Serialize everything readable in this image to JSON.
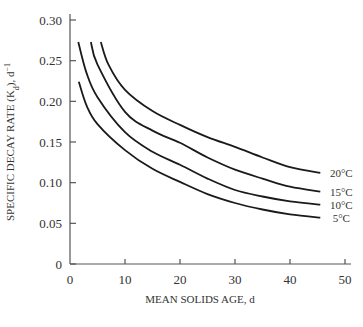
{
  "chart_data": {
    "type": "line",
    "title": "",
    "xlabel": "MEAN SOLIDS AGE, d",
    "ylabel": "SPECIFIC DECAY RATE (K",
    "ylabel_sub": "d",
    "ylabel_suffix": "), d",
    "ylabel_sup": "−1",
    "xlim": [
      0,
      50
    ],
    "ylim": [
      0,
      0.3
    ],
    "xticks": [
      0,
      10,
      20,
      30,
      40,
      50
    ],
    "xtick_labels": [
      "0",
      "10",
      "20",
      "30",
      "40",
      "50"
    ],
    "yticks": [
      0,
      0.05,
      0.1,
      0.15,
      0.2,
      0.25,
      0.3
    ],
    "ytick_labels": [
      "0",
      "0.05",
      "0.10",
      "0.15",
      "0.20",
      "0.25",
      "0.30"
    ],
    "grid": false,
    "legend_position": "inline labels at right end of curves",
    "series": [
      {
        "name": "20°C",
        "x": [
          5.6,
          7,
          10,
          15,
          20,
          25,
          30,
          35,
          40,
          45.5
        ],
        "values": [
          0.273,
          0.245,
          0.214,
          0.188,
          0.171,
          0.156,
          0.144,
          0.131,
          0.119,
          0.112
        ]
      },
      {
        "name": "15°C",
        "x": [
          3.8,
          5,
          10,
          15,
          20,
          25,
          30,
          35,
          40,
          45.5
        ],
        "values": [
          0.273,
          0.245,
          0.187,
          0.164,
          0.149,
          0.131,
          0.116,
          0.105,
          0.095,
          0.089
        ]
      },
      {
        "name": "10°C",
        "x": [
          1.5,
          3,
          5,
          10,
          15,
          20,
          25,
          30,
          35,
          40,
          45.5
        ],
        "values": [
          0.273,
          0.235,
          0.205,
          0.162,
          0.138,
          0.122,
          0.105,
          0.091,
          0.083,
          0.077,
          0.073
        ]
      },
      {
        "name": "5°C",
        "x": [
          1.6,
          3,
          5,
          10,
          15,
          20,
          25,
          30,
          35,
          40,
          45.5
        ],
        "values": [
          0.224,
          0.195,
          0.172,
          0.14,
          0.117,
          0.101,
          0.086,
          0.075,
          0.067,
          0.061,
          0.057
        ]
      }
    ]
  }
}
